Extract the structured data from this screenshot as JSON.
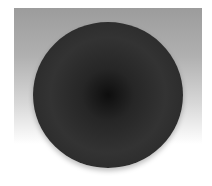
{
  "image": {
    "subject": "dark circular disc",
    "background": "gray-to-white vertical gradient",
    "colors": {
      "backdrop_top": "#9c9c9c",
      "backdrop_bottom": "#ffffff",
      "disc_center": "#0e0e0e",
      "disc_body": "#333333"
    }
  }
}
